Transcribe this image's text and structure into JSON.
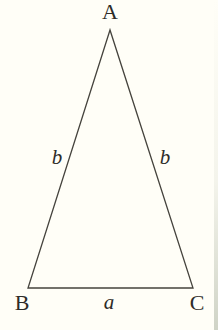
{
  "figure": {
    "background_color": "#fffef7",
    "line_color": "#45433d",
    "text_color": "#2e2c28",
    "triangle": {
      "points": "110,30 28,288 193,288"
    },
    "vertex_labels": [
      {
        "id": "A",
        "label": "A"
      },
      {
        "id": "B",
        "label": "B"
      },
      {
        "id": "C",
        "label": "C"
      }
    ],
    "side_labels": [
      {
        "id": "left",
        "label": "b"
      },
      {
        "id": "right",
        "label": "b"
      },
      {
        "id": "base",
        "label": "a"
      }
    ]
  }
}
